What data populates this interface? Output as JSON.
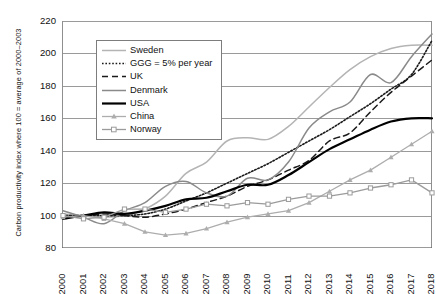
{
  "chart_data": {
    "type": "line",
    "title": "",
    "xlabel": "",
    "ylabel": "Carbon productivity index where 100 = average of 2000–2003",
    "x": [
      2000,
      2001,
      2002,
      2003,
      2004,
      2005,
      2006,
      2007,
      2008,
      2009,
      2010,
      2011,
      2012,
      2013,
      2014,
      2015,
      2016,
      2017,
      2018
    ],
    "xlim": [
      2000,
      2018
    ],
    "ylim": [
      80,
      220
    ],
    "yticks": [
      80,
      100,
      120,
      140,
      160,
      180,
      200,
      220
    ],
    "xticks": [
      "2000",
      "2001",
      "2002",
      "2003",
      "2004",
      "2005",
      "2006",
      "2007",
      "2008",
      "2009",
      "2010",
      "2011",
      "2012",
      "2013",
      "2014",
      "2015",
      "2016",
      "2017",
      "2018"
    ],
    "grid": true,
    "legend_position": "upper-left-inside",
    "series": [
      {
        "name": "Sweden",
        "style": "solid",
        "color": "#b4b4b4",
        "width": 1.5,
        "marker": "none",
        "values": [
          101,
          100,
          99,
          100,
          104,
          112,
          126,
          133,
          146,
          148,
          147,
          155,
          167,
          179,
          190,
          198,
          203,
          205,
          205
        ]
      },
      {
        "name": "GGG = 5% per year",
        "style": "dotted",
        "color": "#1a1a1a",
        "width": 1.6,
        "marker": "none",
        "values": [
          100,
          100,
          100,
          100,
          101,
          104,
          109,
          114,
          120,
          126,
          132,
          139,
          146,
          153,
          161,
          169,
          178,
          187,
          208
        ]
      },
      {
        "name": "UK",
        "style": "dashed",
        "color": "#1a1a1a",
        "width": 1.5,
        "marker": "none",
        "values": [
          99,
          100,
          101,
          100,
          99,
          101,
          104,
          108,
          112,
          118,
          122,
          128,
          134,
          146,
          151,
          164,
          176,
          186,
          196
        ]
      },
      {
        "name": "Denmark",
        "style": "solid",
        "color": "#8a8a8a",
        "width": 1.5,
        "marker": "none",
        "values": [
          103,
          99,
          95,
          103,
          108,
          118,
          121,
          114,
          112,
          123,
          122,
          133,
          154,
          164,
          170,
          187,
          182,
          198,
          212
        ]
      },
      {
        "name": "USA",
        "style": "solid",
        "color": "#000000",
        "width": 2.2,
        "marker": "none",
        "values": [
          98,
          100,
          102,
          101,
          103,
          106,
          110,
          111,
          115,
          119,
          119,
          125,
          133,
          141,
          147,
          153,
          158,
          160,
          160
        ]
      },
      {
        "name": "China",
        "style": "solid-marker",
        "color": "#adadad",
        "width": 1.3,
        "marker": "triangle",
        "values": [
          99,
          100,
          98,
          95,
          90,
          88,
          89,
          92,
          96,
          99,
          101,
          103,
          108,
          115,
          122,
          128,
          136,
          144,
          152
        ]
      },
      {
        "name": "Norway",
        "style": "solid-marker",
        "color": "#9b9b9b",
        "width": 1.3,
        "marker": "square",
        "values": [
          100,
          98,
          99,
          104,
          104,
          102,
          104,
          107,
          106,
          108,
          107,
          110,
          112,
          112,
          114,
          117,
          119,
          122,
          114
        ]
      }
    ]
  },
  "legend": {
    "items": [
      {
        "label": "Sweden"
      },
      {
        "label": "GGG = 5% per year"
      },
      {
        "label": "UK"
      },
      {
        "label": "Denmark"
      },
      {
        "label": "USA"
      },
      {
        "label": "China"
      },
      {
        "label": "Norway"
      }
    ]
  }
}
